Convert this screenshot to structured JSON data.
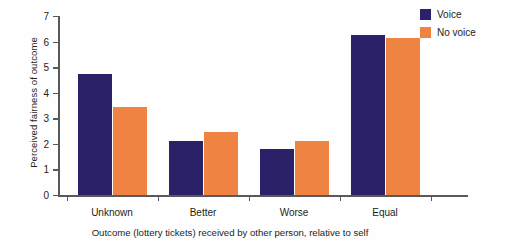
{
  "chart_data": {
    "type": "bar",
    "title": "",
    "subtitle": "",
    "categories": [
      "Unknown",
      "Better",
      "Worse",
      "Equal"
    ],
    "series": [
      {
        "name": "Voice",
        "color": "#2b2168",
        "values": [
          4.75,
          2.1,
          1.8,
          6.25
        ]
      },
      {
        "name": "No voice",
        "color": "#ef8442",
        "values": [
          3.45,
          2.45,
          2.1,
          6.15
        ]
      }
    ],
    "xlabel": "Outcome (lottery tickets) received by other person, relative to self",
    "ylabel": "Perceived fairness of outcome",
    "ylim": [
      0,
      7
    ],
    "yticks": [
      "0",
      "1",
      "2",
      "3",
      "4",
      "5",
      "6",
      "7"
    ],
    "grid": false,
    "legend_position": "top-right"
  },
  "legend": {
    "items": [
      {
        "label": "Voice",
        "color": "#2b2168"
      },
      {
        "label": "No voice",
        "color": "#ef8442"
      }
    ]
  },
  "axes": {
    "y_title": "Perceived fairness of outcome",
    "x_title": "Outcome (lottery tickets) received by other person, relative to self"
  },
  "colors": {
    "voice": "#2b2168",
    "no_voice": "#ef8442",
    "axis": "#58595b",
    "text": "#231f20",
    "background": "#fefefe"
  }
}
